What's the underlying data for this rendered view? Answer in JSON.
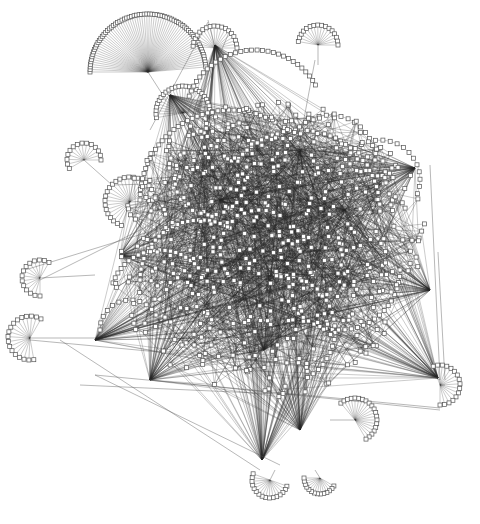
{
  "diagram": {
    "type": "network-graph",
    "background": "#ffffff",
    "node_shape": "square",
    "node_fill": "#ffffff",
    "node_stroke": "#555555",
    "edge_color": "#2a2a2a",
    "width": 480,
    "height": 524
  },
  "fans": [
    {
      "cx": 148,
      "cy": 72,
      "r": 58,
      "start": 180,
      "end": 355,
      "count": 70,
      "link": [
        166,
        100
      ]
    },
    {
      "cx": 215,
      "cy": 48,
      "r": 22,
      "start": 185,
      "end": 360,
      "count": 18,
      "link": [
        208,
        20
      ]
    },
    {
      "cx": 318,
      "cy": 45,
      "r": 20,
      "start": 190,
      "end": 360,
      "count": 16,
      "link": [
        318,
        65
      ]
    },
    {
      "cx": 183,
      "cy": 113,
      "r": 27,
      "start": 170,
      "end": 360,
      "count": 26,
      "link": [
        200,
        150
      ]
    },
    {
      "cx": 84,
      "cy": 160,
      "r": 17,
      "start": 150,
      "end": 360,
      "count": 14,
      "link": [
        112,
        185
      ]
    },
    {
      "cx": 130,
      "cy": 202,
      "r": 25,
      "start": 110,
      "end": 330,
      "count": 22,
      "link": [
        165,
        200
      ]
    },
    {
      "cx": 40,
      "cy": 278,
      "r": 18,
      "start": 90,
      "end": 300,
      "count": 14,
      "link": [
        95,
        275
      ]
    },
    {
      "cx": 30,
      "cy": 338,
      "r": 22,
      "start": 80,
      "end": 300,
      "count": 18,
      "link": [
        98,
        338
      ]
    },
    {
      "cx": 440,
      "cy": 385,
      "r": 20,
      "start": 250,
      "end": 450,
      "count": 16,
      "link": [
        445,
        385
      ]
    },
    {
      "cx": 355,
      "cy": 420,
      "r": 22,
      "start": 230,
      "end": 420,
      "count": 20,
      "link": [
        330,
        420
      ]
    },
    {
      "cx": 270,
      "cy": 480,
      "r": 18,
      "start": 20,
      "end": 200,
      "count": 16,
      "link": [
        275,
        470
      ]
    },
    {
      "cx": 320,
      "cy": 478,
      "r": 16,
      "start": 30,
      "end": 180,
      "count": 14,
      "link": [
        315,
        470
      ]
    }
  ],
  "arcs": [
    {
      "cx": 255,
      "cy": 120,
      "r": 70,
      "start": 200,
      "end": 330,
      "count": 30
    },
    {
      "cx": 230,
      "cy": 200,
      "r": 90,
      "start": 180,
      "end": 300,
      "count": 36
    },
    {
      "cx": 300,
      "cy": 210,
      "r": 80,
      "start": 220,
      "end": 360,
      "count": 34
    },
    {
      "cx": 200,
      "cy": 280,
      "r": 60,
      "start": 180,
      "end": 300,
      "count": 24
    },
    {
      "cx": 160,
      "cy": 300,
      "r": 50,
      "start": 200,
      "end": 320,
      "count": 20
    },
    {
      "cx": 340,
      "cy": 270,
      "r": 60,
      "start": 0,
      "end": 140,
      "count": 24
    },
    {
      "cx": 260,
      "cy": 250,
      "r": 40,
      "start": 120,
      "end": 300,
      "count": 18
    },
    {
      "cx": 330,
      "cy": 160,
      "r": 45,
      "start": 180,
      "end": 360,
      "count": 20
    },
    {
      "cx": 210,
      "cy": 180,
      "r": 35,
      "start": 0,
      "end": 200,
      "count": 16
    },
    {
      "cx": 280,
      "cy": 330,
      "r": 55,
      "start": 270,
      "end": 420,
      "count": 22
    },
    {
      "cx": 130,
      "cy": 330,
      "r": 30,
      "start": 180,
      "end": 330,
      "count": 12
    },
    {
      "cx": 380,
      "cy": 180,
      "r": 40,
      "start": 200,
      "end": 380,
      "count": 18
    }
  ],
  "hubs": [
    [
      264,
      350
    ],
    [
      438,
      378
    ],
    [
      95,
      340
    ],
    [
      150,
      380
    ],
    [
      345,
      210
    ],
    [
      300,
      430
    ],
    [
      262,
      460
    ],
    [
      170,
      95
    ],
    [
      215,
      45
    ],
    [
      415,
      168
    ],
    [
      220,
      200
    ],
    [
      300,
      150
    ],
    [
      120,
      255
    ],
    [
      430,
      290
    ]
  ],
  "scatter": {
    "cx": 268,
    "cy": 250,
    "rx": 150,
    "ry": 150,
    "count": 520,
    "seed": 7
  },
  "long_edges": [
    [
      95,
      375,
      440,
      408
    ],
    [
      95,
      375,
      280,
      465
    ],
    [
      150,
      380,
      440,
      410
    ],
    [
      40,
      280,
      300,
      150
    ],
    [
      30,
      340,
      438,
      378
    ],
    [
      438,
      252,
      445,
      380
    ],
    [
      208,
      22,
      150,
      130
    ],
    [
      230,
      30,
      180,
      150
    ],
    [
      315,
      60,
      300,
      140
    ],
    [
      430,
      165,
      440,
      380
    ],
    [
      25,
      270,
      220,
      210
    ],
    [
      112,
      185,
      300,
      180
    ],
    [
      440,
      380,
      340,
      330
    ],
    [
      80,
      385,
      300,
      395
    ],
    [
      60,
      340,
      260,
      470
    ]
  ]
}
